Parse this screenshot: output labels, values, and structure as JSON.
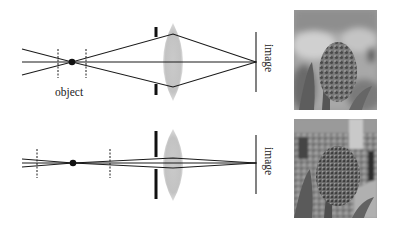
{
  "figure": {
    "panels": [
      {
        "id": "large-aperture",
        "labels": {
          "object": "object",
          "image": "image"
        },
        "aperture": "wide",
        "photo_caption": "",
        "photo_description": "Flower (hyacinth) in focus with strongly blurred background"
      },
      {
        "id": "small-aperture",
        "labels": {
          "image": "image"
        },
        "aperture": "narrow",
        "photo_caption": "",
        "photo_description": "Flower (hyacinth) in focus with sharper background street scene"
      }
    ]
  },
  "colors": {
    "line": "#1a1a1a",
    "lens": "#b8b8b8",
    "background": "#ffffff"
  }
}
